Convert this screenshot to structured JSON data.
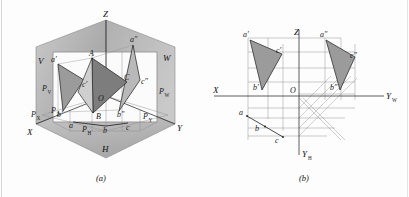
{
  "figure": {
    "captions": {
      "left": "(a)",
      "right": "(b)"
    },
    "colors": {
      "plane_fill_v": "#b4b4b4",
      "plane_fill_w": "#a8a8a8",
      "plane_fill_h": "#c2c2c2",
      "triangle_dark": "#7d7d7d",
      "triangle_mid": "#9b9b9b",
      "triangle_light": "#b9b9b9",
      "line": "#1c1c1c",
      "thin_line": "#8d8d8d",
      "background": "#fdfdfd"
    }
  },
  "panel_a": {
    "name": "pictorial-three-plane-view",
    "axis_labels": [
      {
        "id": "axis-x",
        "text": "X"
      },
      {
        "id": "axis-y",
        "text": "Y"
      },
      {
        "id": "axis-z",
        "text": "Z"
      },
      {
        "id": "origin",
        "text": "O"
      }
    ],
    "plane_labels": [
      {
        "id": "plane-v",
        "text": "V"
      },
      {
        "id": "plane-w",
        "text": "W"
      },
      {
        "id": "plane-h",
        "text": "H"
      }
    ],
    "trace_labels": [
      {
        "id": "trace-pv",
        "base": "P",
        "sub": "V"
      },
      {
        "id": "trace-pw",
        "base": "P",
        "sub": "W"
      },
      {
        "id": "trace-ph",
        "base": "P",
        "sub": "H"
      },
      {
        "id": "trace-px",
        "base": "P",
        "sub": "X"
      },
      {
        "id": "trace-pz",
        "base": "P",
        "sub": "Z"
      },
      {
        "id": "trace-py",
        "base": "P",
        "sub": "Y"
      }
    ],
    "point_labels": [
      {
        "id": "pt-A-space",
        "text": "A"
      },
      {
        "id": "pt-B-space",
        "text": "B"
      },
      {
        "id": "pt-C-space",
        "text": "C"
      },
      {
        "id": "pt-a-front",
        "text": "a′"
      },
      {
        "id": "pt-b-front",
        "text": "b′"
      },
      {
        "id": "pt-c-front",
        "text": "c′"
      },
      {
        "id": "pt-a-side",
        "text": "a″"
      },
      {
        "id": "pt-b-side",
        "text": "b″"
      },
      {
        "id": "pt-c-side",
        "text": "c″"
      },
      {
        "id": "pt-a-top",
        "text": "a"
      },
      {
        "id": "pt-b-top",
        "text": "b"
      },
      {
        "id": "pt-c-top",
        "text": "c"
      }
    ]
  },
  "panel_b": {
    "name": "unfolded-orthographic-view",
    "axis_labels": [
      {
        "id": "axis-x",
        "text": "X",
        "sub": ""
      },
      {
        "id": "axis-z",
        "text": "Z",
        "sub": ""
      },
      {
        "id": "axis-yw",
        "text": "Y",
        "sub": "W"
      },
      {
        "id": "axis-yh",
        "text": "Y",
        "sub": "H"
      },
      {
        "id": "origin",
        "text": "O",
        "sub": ""
      }
    ],
    "point_labels": [
      {
        "id": "pt-a-front",
        "text": "a′"
      },
      {
        "id": "pt-b-front",
        "text": "b′"
      },
      {
        "id": "pt-c-front",
        "text": "c′"
      },
      {
        "id": "pt-a-side",
        "text": "a″"
      },
      {
        "id": "pt-b-side",
        "text": "b″"
      },
      {
        "id": "pt-c-side",
        "text": "c″"
      },
      {
        "id": "pt-a-top",
        "text": "a"
      },
      {
        "id": "pt-b-top",
        "text": "b"
      },
      {
        "id": "pt-c-top",
        "text": "c"
      }
    ]
  }
}
